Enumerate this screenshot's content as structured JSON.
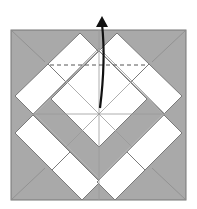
{
  "diagram": {
    "type": "origami-fold-step",
    "colors": {
      "background": "#ffffff",
      "paper_colored": "#a9a9a9",
      "paper_white": "#ffffff",
      "crease": "#8a8a8a",
      "edge": "#777777",
      "arrow": "#111111",
      "valley_fold": "#555555"
    },
    "square": {
      "x": 11,
      "y": 30,
      "w": 175,
      "h": 170
    },
    "center": {
      "x": 99,
      "y": 114
    },
    "fold_line": {
      "style": "dashed",
      "y": 65,
      "x1": 50,
      "x2": 148
    },
    "arrow": {
      "direction": "up",
      "from": {
        "x": 100,
        "y": 108
      },
      "to": {
        "x": 102,
        "y": 18
      },
      "icon": "fold-up-arrow"
    }
  }
}
